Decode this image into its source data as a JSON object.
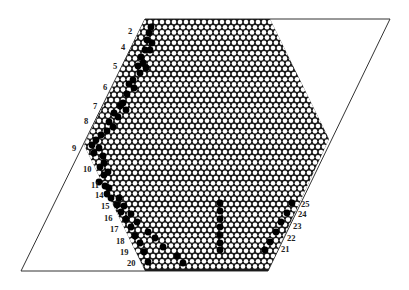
{
  "diagram": {
    "type": "hexagonal-lattice-with-defect-paths",
    "parallelogram": {
      "points": [
        [
          145,
          19
        ],
        [
          390,
          19
        ],
        [
          268,
          271
        ],
        [
          21,
          271
        ]
      ],
      "stroke": "#333333"
    },
    "hexagon": {
      "top_left": [
        145,
        19
      ],
      "top_right": [
        270,
        19
      ],
      "right": [
        329,
        139
      ],
      "bottom_right": [
        268,
        271
      ],
      "bottom_left": [
        145,
        271
      ],
      "left": [
        84,
        145
      ],
      "fill": "#1a1a1a",
      "dot_color": "#ffffff",
      "defect_color": "#000000",
      "dx": 6.0,
      "dy": 5.2
    },
    "labels_left": [
      {
        "text": "2",
        "x": 128,
        "y": 34
      },
      {
        "text": "4",
        "x": 121,
        "y": 50
      },
      {
        "text": "5",
        "x": 113,
        "y": 69
      },
      {
        "text": "6",
        "x": 103,
        "y": 90
      },
      {
        "text": "7",
        "x": 93,
        "y": 109
      },
      {
        "text": "8",
        "x": 84,
        "y": 124
      },
      {
        "text": "9",
        "x": 72,
        "y": 151
      },
      {
        "text": "10",
        "x": 83,
        "y": 172
      },
      {
        "text": "11",
        "x": 91,
        "y": 188
      },
      {
        "text": "14",
        "x": 95,
        "y": 198
      },
      {
        "text": "15",
        "x": 101,
        "y": 209
      },
      {
        "text": "16",
        "x": 104,
        "y": 221
      },
      {
        "text": "17",
        "x": 110,
        "y": 232
      },
      {
        "text": "18",
        "x": 116,
        "y": 244
      },
      {
        "text": "19",
        "x": 120,
        "y": 255
      },
      {
        "text": "20",
        "x": 127,
        "y": 266
      }
    ],
    "labels_right": [
      {
        "text": "25",
        "x": 301,
        "y": 207
      },
      {
        "text": "24",
        "x": 298,
        "y": 217
      },
      {
        "text": "23",
        "x": 293,
        "y": 229
      },
      {
        "text": "22",
        "x": 287,
        "y": 241
      },
      {
        "text": "21",
        "x": 281,
        "y": 252
      }
    ],
    "defects": [
      [
        151,
        27
      ],
      [
        149,
        33
      ],
      [
        147,
        40
      ],
      [
        152,
        43
      ],
      [
        145,
        50
      ],
      [
        150,
        50
      ],
      [
        141,
        57
      ],
      [
        143,
        63
      ],
      [
        138,
        66
      ],
      [
        146,
        68
      ],
      [
        140,
        73
      ],
      [
        133,
        80
      ],
      [
        129,
        84
      ],
      [
        134,
        88
      ],
      [
        127,
        94
      ],
      [
        123,
        103
      ],
      [
        120,
        106
      ],
      [
        126,
        110
      ],
      [
        114,
        113
      ],
      [
        118,
        117
      ],
      [
        109,
        122
      ],
      [
        113,
        127
      ],
      [
        107,
        131
      ],
      [
        101,
        135
      ],
      [
        96,
        140
      ],
      [
        92,
        145
      ],
      [
        99,
        148
      ],
      [
        94,
        153
      ],
      [
        103,
        156
      ],
      [
        104,
        163
      ],
      [
        100,
        167
      ],
      [
        108,
        172
      ],
      [
        104,
        175
      ],
      [
        99,
        182
      ],
      [
        105,
        186
      ],
      [
        109,
        188
      ],
      [
        107,
        194
      ],
      [
        111,
        198
      ],
      [
        119,
        198
      ],
      [
        117,
        205
      ],
      [
        124,
        206
      ],
      [
        121,
        212
      ],
      [
        131,
        214
      ],
      [
        126,
        219
      ],
      [
        137,
        222
      ],
      [
        131,
        227
      ],
      [
        148,
        232
      ],
      [
        135,
        236
      ],
      [
        155,
        238
      ],
      [
        140,
        243
      ],
      [
        163,
        247
      ],
      [
        144,
        252
      ],
      [
        177,
        256
      ],
      [
        148,
        262
      ],
      [
        183,
        263
      ],
      [
        220,
        203
      ],
      [
        220,
        211
      ],
      [
        220,
        219
      ],
      [
        220,
        227
      ],
      [
        220,
        235
      ],
      [
        220,
        243
      ],
      [
        220,
        250
      ],
      [
        292,
        203
      ],
      [
        287,
        213
      ],
      [
        281,
        222
      ],
      [
        276,
        232
      ],
      [
        270,
        242
      ],
      [
        265,
        250
      ]
    ]
  }
}
